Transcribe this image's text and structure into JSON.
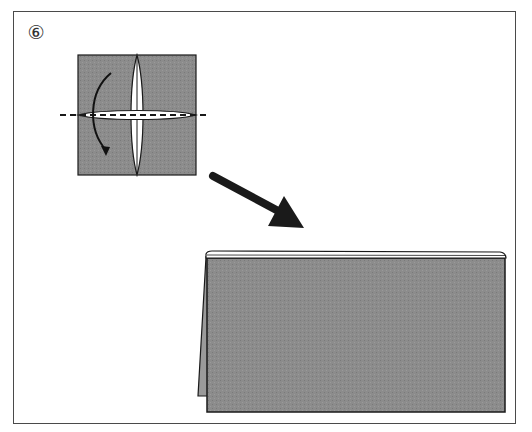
{
  "diagram": {
    "step_number": "⑥",
    "step_label": "Step 6",
    "colors": {
      "paper": "#8a8a8a",
      "outline": "#1a1a1a",
      "frame": "#4a4a4a",
      "background": "#ffffff"
    },
    "elements": {
      "before": "Square paper with cross-shaped slit opening, dashed valley-fold line across middle",
      "fold_arrow": "Curved arrow indicating fold downward along dashed line",
      "transition_arrow": "Bold arrow pointing to result",
      "after": "Folded rectangle standing as tent shape with back flap visible"
    }
  }
}
